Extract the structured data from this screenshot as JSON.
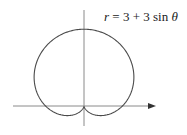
{
  "chart_data": {
    "type": "line",
    "subtype": "polar",
    "title": "",
    "equation": "r = 3 + 3 sin θ",
    "label": {
      "r": "r",
      "eq": " = 3 + 3 sin ",
      "theta": "θ"
    },
    "function": {
      "a": 3,
      "b": 3,
      "trig": "sin"
    },
    "theta_range": [
      0,
      6.283185307
    ],
    "samples": 360,
    "r_max": 6,
    "x_extent": [
      -3.897,
      3.897
    ],
    "y_extent": [
      -0.75,
      6
    ],
    "cusp": [
      0,
      0
    ],
    "axes": {
      "x_axis_arrow": true,
      "y_axis_arrow": false,
      "ticks": false,
      "grid": false
    },
    "xlabel": "",
    "ylabel": "",
    "colors": {
      "curve": "#4a4a4a",
      "axes": "#8a8a8a",
      "arrow": "#333333"
    }
  }
}
